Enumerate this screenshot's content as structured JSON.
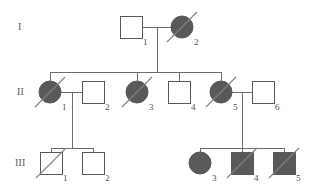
{
  "figure": {
    "type": "pedigree-chart",
    "width": 311,
    "height": 191,
    "background_color": "#ffffff",
    "line_color": "#6d6e71",
    "symbol_stroke_color": "#58595b",
    "affected_fill_color": "#58595b",
    "unaffected_fill_color": "#ffffff",
    "slash_color": "#808285",
    "label_color": "#4d4d4f"
  },
  "legend_semantics": {
    "square": "male",
    "circle": "female",
    "filled": "affected",
    "open": "unaffected",
    "slash": "deceased"
  },
  "generations": [
    {
      "id": "I",
      "label": "I",
      "label_x": 18,
      "label_y": 27,
      "row_y": 27
    },
    {
      "id": "II",
      "label": "II",
      "label_x": 17,
      "label_y": 92,
      "row_y": 92
    },
    {
      "id": "III",
      "label": "III",
      "label_x": 15,
      "label_y": 163,
      "row_y": 163
    }
  ],
  "individuals": [
    {
      "name": "I-1",
      "generation": "I",
      "number": "1",
      "sex": "male",
      "shape": "square",
      "affected": false,
      "deceased": false,
      "cx": 131,
      "cy": 27,
      "size": 22,
      "num_x": 143,
      "num_y": 38
    },
    {
      "name": "I-2",
      "generation": "I",
      "number": "2",
      "sex": "female",
      "shape": "circle",
      "affected": true,
      "deceased": true,
      "cx": 182,
      "cy": 27,
      "size": 22,
      "num_x": 194,
      "num_y": 38
    },
    {
      "name": "II-1",
      "generation": "II",
      "number": "1",
      "sex": "female",
      "shape": "circle",
      "affected": true,
      "deceased": true,
      "cx": 50,
      "cy": 92,
      "size": 22,
      "num_x": 62,
      "num_y": 103
    },
    {
      "name": "II-2",
      "generation": "II",
      "number": "2",
      "sex": "male",
      "shape": "square",
      "affected": false,
      "deceased": false,
      "cx": 93,
      "cy": 92,
      "size": 22,
      "num_x": 105,
      "num_y": 103
    },
    {
      "name": "II-3",
      "generation": "II",
      "number": "3",
      "sex": "female",
      "shape": "circle",
      "affected": true,
      "deceased": true,
      "cx": 137,
      "cy": 92,
      "size": 22,
      "num_x": 149,
      "num_y": 103
    },
    {
      "name": "II-4",
      "generation": "II",
      "number": "4",
      "sex": "male",
      "shape": "square",
      "affected": false,
      "deceased": false,
      "cx": 179,
      "cy": 92,
      "size": 22,
      "num_x": 191,
      "num_y": 103
    },
    {
      "name": "II-5",
      "generation": "II",
      "number": "5",
      "sex": "female",
      "shape": "circle",
      "affected": true,
      "deceased": true,
      "cx": 221,
      "cy": 92,
      "size": 22,
      "num_x": 233,
      "num_y": 103
    },
    {
      "name": "II-6",
      "generation": "II",
      "number": "6",
      "sex": "male",
      "shape": "square",
      "affected": false,
      "deceased": false,
      "cx": 263,
      "cy": 92,
      "size": 22,
      "num_x": 275,
      "num_y": 103
    },
    {
      "name": "III-1",
      "generation": "III",
      "number": "1",
      "sex": "male",
      "shape": "square",
      "affected": false,
      "deceased": true,
      "cx": 51,
      "cy": 163,
      "size": 22,
      "num_x": 63,
      "num_y": 174
    },
    {
      "name": "III-2",
      "generation": "III",
      "number": "2",
      "sex": "male",
      "shape": "square",
      "affected": false,
      "deceased": false,
      "cx": 93,
      "cy": 163,
      "size": 22,
      "num_x": 105,
      "num_y": 174
    },
    {
      "name": "III-3",
      "generation": "III",
      "number": "3",
      "sex": "female",
      "shape": "circle",
      "affected": true,
      "deceased": false,
      "cx": 200,
      "cy": 163,
      "size": 22,
      "num_x": 212,
      "num_y": 174
    },
    {
      "name": "III-4",
      "generation": "III",
      "number": "4",
      "sex": "male",
      "shape": "square",
      "affected": true,
      "deceased": true,
      "cx": 242,
      "cy": 163,
      "size": 22,
      "num_x": 254,
      "num_y": 174
    },
    {
      "name": "III-5",
      "generation": "III",
      "number": "5",
      "sex": "male",
      "shape": "square",
      "affected": true,
      "deceased": true,
      "cx": 284,
      "cy": 163,
      "size": 22,
      "num_x": 296,
      "num_y": 174
    }
  ],
  "matings": [
    {
      "name": "mating-I1-I2",
      "partners": [
        "I-1",
        "I-2"
      ],
      "line_y": 27,
      "x1": 142,
      "x2": 171,
      "descent_x": 157,
      "descent_y1": 27,
      "descent_y2": 72
    },
    {
      "name": "mating-II1-II2",
      "partners": [
        "II-1",
        "II-2"
      ],
      "line_y": 92,
      "x1": 61,
      "x2": 82,
      "descent_x": 72,
      "descent_y1": 92,
      "descent_y2": 148
    },
    {
      "name": "mating-II5-II6",
      "partners": [
        "II-5",
        "II-6"
      ],
      "line_y": 92,
      "x1": 232,
      "x2": 252,
      "descent_x": 242,
      "descent_y1": 92,
      "descent_y2": 148
    }
  ],
  "sibships": [
    {
      "name": "sibship-generation-II",
      "bar_y": 72,
      "x1": 50,
      "x2": 221,
      "child_drops": [
        50,
        137,
        179,
        221
      ],
      "drop_to_y": 81,
      "children": [
        "II-1",
        "II-3",
        "II-4",
        "II-5"
      ]
    },
    {
      "name": "sibship-III-left",
      "bar_y": 148,
      "x1": 51,
      "x2": 93,
      "child_drops": [
        51,
        93
      ],
      "drop_to_y": 152,
      "children": [
        "III-1",
        "III-2"
      ]
    },
    {
      "name": "sibship-III-right",
      "bar_y": 148,
      "x1": 200,
      "x2": 284,
      "child_drops": [
        200,
        242,
        284
      ],
      "drop_to_y": 152,
      "children": [
        "III-3",
        "III-4",
        "III-5"
      ]
    }
  ]
}
